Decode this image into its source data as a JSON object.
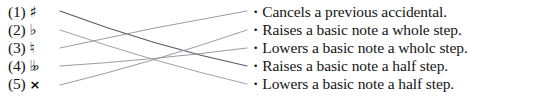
{
  "document": {
    "kind": "matching-exercise",
    "title": "Accidentals matching exercise",
    "background_color": "#ffffff",
    "text_color": "#141414",
    "line_color": "#8c8c96"
  },
  "left_column": {
    "items": [
      {
        "number": "(1)",
        "symbol": "♯",
        "symbol_name": "sharp-symbol",
        "y": 3
      },
      {
        "number": "(2)",
        "symbol": "♭",
        "symbol_name": "flat-symbol",
        "y": 21
      },
      {
        "number": "(3)",
        "symbol": "♮",
        "symbol_name": "natural-symbol",
        "y": 39
      },
      {
        "number": "(4)",
        "symbol": "♭♭",
        "symbol_name": "double-flat-symbol",
        "y": 57
      },
      {
        "number": "(5)",
        "symbol": "×",
        "symbol_name": "double-sharp-symbol",
        "y": 75
      }
    ]
  },
  "right_column": {
    "bullet": "•",
    "items": [
      {
        "text": "Cancels a previous accidental.",
        "y": 3
      },
      {
        "text": "Raises a basic note a whole step.",
        "y": 21
      },
      {
        "text": "Lowers a basic note a wholc step.",
        "y": 39
      },
      {
        "text": "Raises a basic note a half step.",
        "y": 57
      },
      {
        "text": "Lowers a basic note a half step.",
        "y": 75
      }
    ]
  },
  "connectors": {
    "stroke": "#8f8f99",
    "stroke_dark": "#5a5a64",
    "lines": [
      {
        "from_item": 1,
        "to_item": 4,
        "x1": 60,
        "y1": 11,
        "x2": 247,
        "y2": 66,
        "curve_y": 46,
        "width": 1.15,
        "shade": "dark"
      },
      {
        "from_item": 2,
        "to_item": 5,
        "x1": 60,
        "y1": 30,
        "x2": 247,
        "y2": 84,
        "curve_y": 62,
        "width": 0.85,
        "shade": "light"
      },
      {
        "from_item": 3,
        "to_item": 1,
        "x1": 60,
        "y1": 48,
        "x2": 247,
        "y2": 11,
        "curve_y": 27,
        "width": 0.9,
        "shade": "light"
      },
      {
        "from_item": 4,
        "to_item": 3,
        "x1": 60,
        "y1": 66,
        "x2": 247,
        "y2": 48,
        "curve_y": 60,
        "width": 0.9,
        "shade": "light"
      },
      {
        "from_item": 5,
        "to_item": 2,
        "x1": 60,
        "y1": 85,
        "x2": 247,
        "y2": 30,
        "curve_y": 62,
        "width": 0.9,
        "shade": "light"
      }
    ]
  }
}
